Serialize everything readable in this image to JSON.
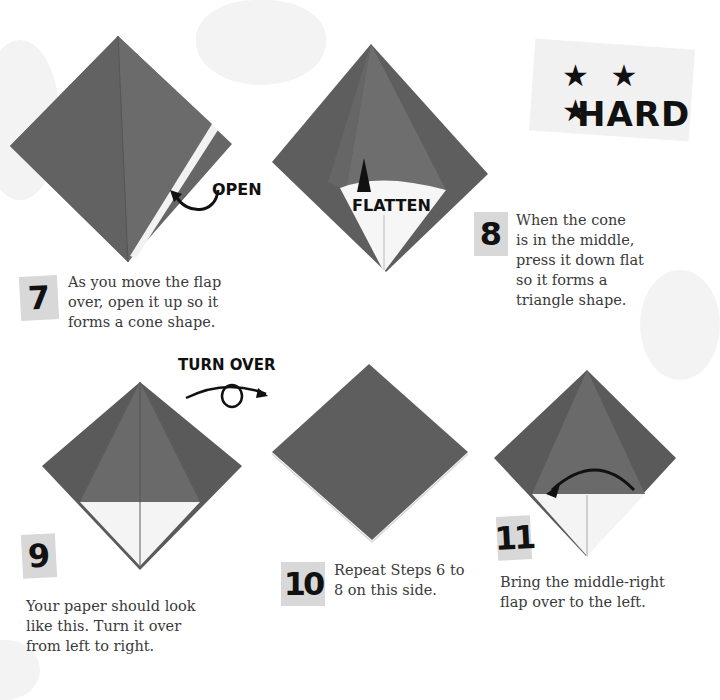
{
  "difficulty": {
    "stars": "★ ★ ★",
    "level": "HARD"
  },
  "steps": [
    {
      "number": "7",
      "text": "As you move the flap\nover, open it up so it\nforms a cone shape.",
      "annotation": "OPEN"
    },
    {
      "number": "8",
      "text": "When the cone\nis in the middle,\npress it down flat\nso it forms a\ntriangle shape.",
      "annotation": "FLATTEN"
    },
    {
      "number": "9",
      "text": "Your paper should look\nlike this. Turn it over\nfrom left to right.",
      "annotation": "TURN OVER"
    },
    {
      "number": "10",
      "text": "Repeat Steps 6 to\n8 on this side."
    },
    {
      "number": "11",
      "text": "Bring the middle-right\nflap over to the left."
    }
  ],
  "colors": {
    "paper_dark": "#5a5a5a",
    "paper_mid": "#6a6a6a",
    "paper_white": "#f4f4f4",
    "number_tile": "#d8d8d8",
    "ink": "#111111"
  }
}
